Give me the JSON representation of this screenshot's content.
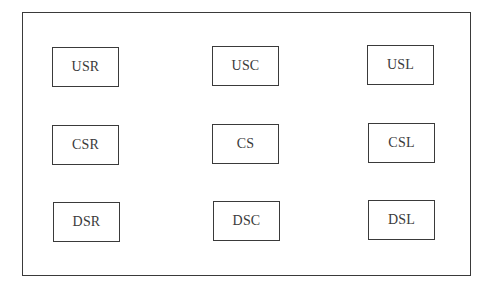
{
  "diagram": {
    "areas": [
      {
        "id": "usr",
        "label": "USR",
        "row": "upstage",
        "col": "right"
      },
      {
        "id": "usc",
        "label": "USC",
        "row": "upstage",
        "col": "center"
      },
      {
        "id": "usl",
        "label": "USL",
        "row": "upstage",
        "col": "left"
      },
      {
        "id": "csr",
        "label": "CSR",
        "row": "center",
        "col": "right"
      },
      {
        "id": "cs",
        "label": "CS",
        "row": "center",
        "col": "center"
      },
      {
        "id": "csl",
        "label": "CSL",
        "row": "center",
        "col": "left"
      },
      {
        "id": "dsr",
        "label": "DSR",
        "row": "downstage",
        "col": "right"
      },
      {
        "id": "dsc",
        "label": "DSC",
        "row": "downstage",
        "col": "center"
      },
      {
        "id": "dsl",
        "label": "DSL",
        "row": "downstage",
        "col": "left"
      }
    ],
    "colors": {
      "stroke": "#3a3a3a",
      "background": "#ffffff",
      "text": "#3a3a3a"
    }
  }
}
